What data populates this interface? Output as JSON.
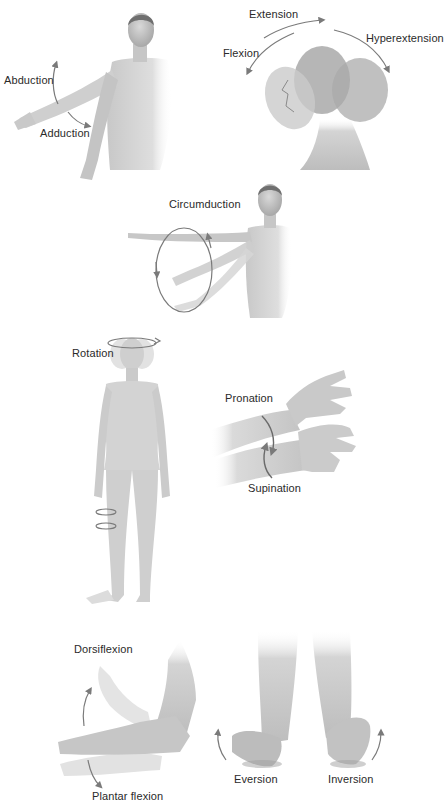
{
  "colors": {
    "background": "#ffffff",
    "skin_light": "#dcdcdc",
    "skin_mid": "#bdbdbd",
    "skin_dark": "#9a9a9a",
    "arrow": "#7a7a7a",
    "text": "#2a2a2a"
  },
  "panels": {
    "shoulder": {
      "name": "shoulder-abduction-adduction",
      "labels": {
        "abduction": "Abduction",
        "adduction": "Adduction"
      }
    },
    "head": {
      "name": "head-flexion-extension",
      "labels": {
        "extension": "Extension",
        "flexion": "Flexion",
        "hyperextension": "Hyperextension"
      }
    },
    "circumduction": {
      "name": "arm-circumduction",
      "labels": {
        "circumduction": "Circumduction"
      }
    },
    "rotation": {
      "name": "body-rotation",
      "labels": {
        "rotation": "Rotation"
      }
    },
    "forearm": {
      "name": "forearm-pronation-supination",
      "labels": {
        "pronation": "Pronation",
        "supination": "Supination"
      }
    },
    "ankle": {
      "name": "ankle-dorsiflexion-plantarflexion",
      "labels": {
        "dorsiflexion": "Dorsiflexion",
        "plantar_flexion": "Plantar flexion"
      }
    },
    "feet": {
      "name": "foot-eversion-inversion",
      "labels": {
        "eversion": "Eversion",
        "inversion": "Inversion"
      }
    }
  }
}
